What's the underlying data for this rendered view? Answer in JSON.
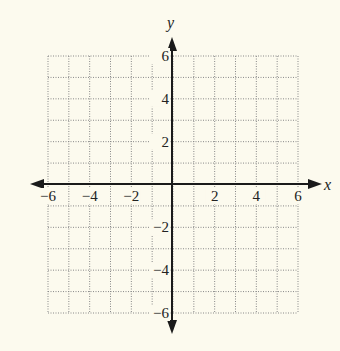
{
  "chart_data": {
    "type": "scatter",
    "title": "",
    "xlabel": "x",
    "ylabel": "y",
    "xlim": [
      -6,
      6
    ],
    "ylim": [
      -6,
      6
    ],
    "grid": true,
    "grid_step": 1,
    "grid_style": "dotted",
    "x_ticks": [
      -6,
      -4,
      -2,
      2,
      4,
      6
    ],
    "y_ticks": [
      -6,
      -4,
      -2,
      2,
      4,
      6
    ],
    "x_tick_labels": [
      "−6",
      "−4",
      "−2",
      "2",
      "4",
      "6"
    ],
    "y_tick_labels": [
      "−6",
      "−4",
      "−2",
      "2",
      "4",
      "6"
    ],
    "series": [],
    "legend": null
  },
  "colors": {
    "background": "#fcfaee",
    "grid": "#888888",
    "axis": "#1a1a1a"
  }
}
